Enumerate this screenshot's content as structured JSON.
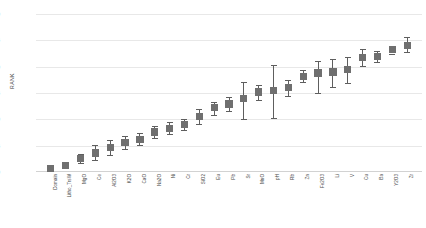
{
  "chart_data": {
    "type": "scatter",
    "title": "",
    "xlabel": "",
    "ylabel": "RANK",
    "ylim": [
      0,
      30
    ],
    "yticks": [
      0,
      5,
      10,
      15,
      20,
      25,
      30
    ],
    "grid": true,
    "legend": null,
    "marker_color": "#6f6f6f",
    "errorbar_color": "#5e5e5e",
    "gridline_color": "#e8e8e8",
    "categories": [
      "Domain",
      "Litho_TrsW",
      "MgO",
      "Ce",
      "Al2O3",
      "K2O",
      "CaO",
      "Na2O",
      "Ni",
      "Cr",
      "SiO2",
      "Eu",
      "Pb",
      "Sr",
      "MnO",
      "pH",
      "Rb",
      "Zn",
      "Fe2O3",
      "Li",
      "V",
      "Cu",
      "Ba",
      "Y2O3",
      "Zr"
    ],
    "values": [
      0.6,
      1.3,
      2.6,
      3.6,
      4.7,
      5.6,
      6.2,
      7.6,
      8.3,
      9.0,
      10.6,
      12.2,
      12.9,
      14.0,
      15.2,
      15.4,
      16.0,
      18.2,
      18.8,
      19.0,
      19.5,
      21.7,
      21.9,
      23.2,
      24.0
    ],
    "err_low": [
      0.2,
      0.7,
      1.8,
      2.3,
      3.2,
      4.4,
      5.1,
      6.4,
      7.3,
      8.0,
      9.2,
      10.9,
      11.6,
      10.0,
      13.7,
      10.2,
      14.4,
      17.0,
      15.0,
      16.1,
      16.9,
      20.2,
      20.9,
      22.5,
      22.7
    ],
    "err_high": [
      1.0,
      1.9,
      3.4,
      5.2,
      6.0,
      6.9,
      7.4,
      8.8,
      9.4,
      10.1,
      11.9,
      13.3,
      14.3,
      17.0,
      16.6,
      20.3,
      17.5,
      19.3,
      21.0,
      21.4,
      21.9,
      23.4,
      23.0,
      24.0,
      25.6
    ]
  }
}
